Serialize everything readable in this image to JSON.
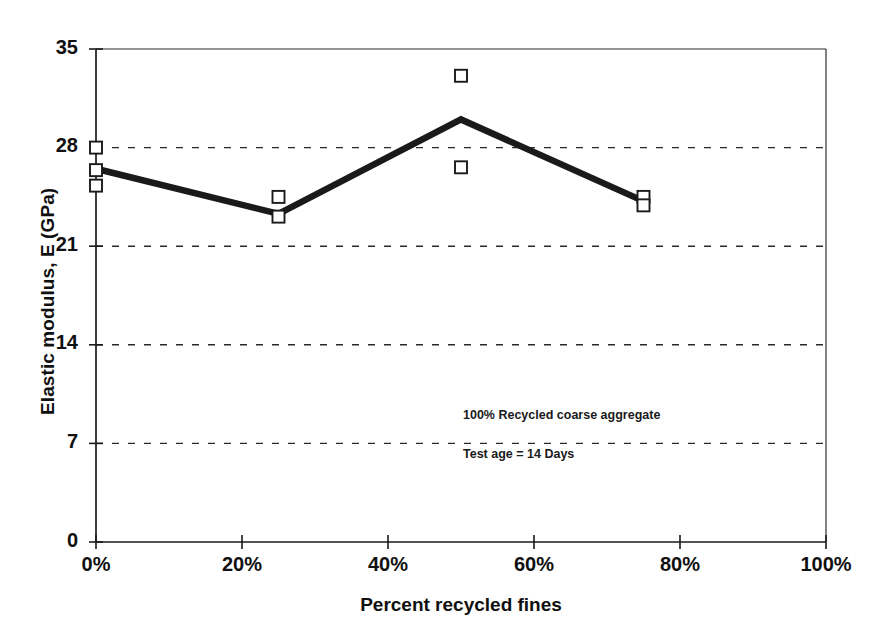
{
  "chart_data": {
    "type": "line",
    "title": "",
    "subtitle": "",
    "xlabel": "Percent recycled fines",
    "ylabel": "Elastic modulus, E (GPa)",
    "xlim": [
      0,
      100
    ],
    "ylim": [
      0,
      35
    ],
    "xticks": [
      0,
      20,
      40,
      60,
      80,
      100
    ],
    "xticklabels": [
      "0%",
      "20%",
      "40%",
      "60%",
      "80%",
      "100%"
    ],
    "yticks": [
      0,
      7,
      14,
      21,
      28,
      35
    ],
    "yticklabels": [
      "0",
      "7",
      "14",
      "21",
      "28",
      "35"
    ],
    "grid": "horizontal-dashed",
    "legend": "none",
    "x": [
      0,
      25,
      50,
      75
    ],
    "series": [
      {
        "name": "Mean elastic modulus",
        "marker": "none",
        "line": "solid-thick",
        "color": "#1a1a1a",
        "values": [
          26.5,
          23.3,
          30.0,
          24.2
        ]
      },
      {
        "name": "Individual specimen results",
        "marker": "open-square",
        "line": "none",
        "color": "#1a1a1a",
        "points": [
          {
            "x": 0,
            "y": 28.0
          },
          {
            "x": 0,
            "y": 26.4
          },
          {
            "x": 0,
            "y": 25.3
          },
          {
            "x": 25,
            "y": 24.5
          },
          {
            "x": 25,
            "y": 23.1
          },
          {
            "x": 50,
            "y": 33.1
          },
          {
            "x": 50,
            "y": 26.6
          },
          {
            "x": 75,
            "y": 24.5
          },
          {
            "x": 75,
            "y": 23.9
          }
        ]
      }
    ],
    "annotations": [
      {
        "text": "100% Recycled coarse aggregate",
        "x": 32,
        "y": 9.8
      },
      {
        "text": "Test  age = 14 Days",
        "x": 32,
        "y": 7.0
      }
    ]
  },
  "axis": {
    "y_title": "Elastic modulus, E (GPa)",
    "x_title": "Percent recycled fines"
  }
}
